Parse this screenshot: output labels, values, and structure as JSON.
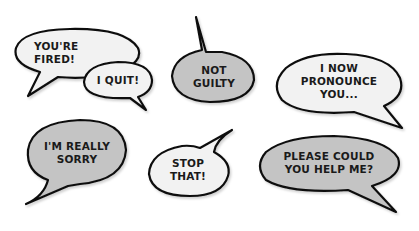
{
  "colors": {
    "white_fill": "#f2f2f2",
    "gray_fill": "#c4c4c4",
    "outline": "#111111",
    "text": "#1a1a1a"
  },
  "bubbles": [
    {
      "id": "youre-fired",
      "text": "YOU'RE\nFIRED!",
      "fill": "white"
    },
    {
      "id": "i-quit",
      "text": "I QUIT!",
      "fill": "white"
    },
    {
      "id": "not-guilty",
      "text": "NOT\nGUILTY",
      "fill": "gray"
    },
    {
      "id": "i-now-pronounce-you",
      "text": "I NOW\nPRONOUNCE\nYOU...",
      "fill": "white"
    },
    {
      "id": "im-really-sorry",
      "text": "I'M REALLY\nSORRY",
      "fill": "gray"
    },
    {
      "id": "stop-that",
      "text": "STOP\nTHAT!",
      "fill": "white"
    },
    {
      "id": "please-could-you-help-me",
      "text": "PLEASE COULD\nYOU HELP ME?",
      "fill": "gray"
    }
  ]
}
